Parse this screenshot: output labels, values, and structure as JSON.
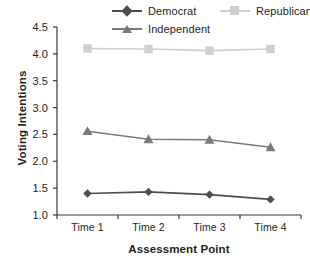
{
  "chart_data": {
    "type": "line",
    "title": "",
    "xlabel": "Assessment Point",
    "ylabel": "Voting Intentions",
    "categories": [
      "Time 1",
      "Time 2",
      "Time 3",
      "Time 4"
    ],
    "ylim": [
      1.0,
      4.5
    ],
    "yticks": [
      "1.0",
      "1.5",
      "2.0",
      "2.5",
      "3.0",
      "3.5",
      "4.0",
      "4.5"
    ],
    "ytick_values": [
      1.0,
      1.5,
      2.0,
      2.5,
      3.0,
      3.5,
      4.0,
      4.5
    ],
    "grid": false,
    "legend_position": "top",
    "series": [
      {
        "name": "Democrat",
        "marker": "diamond",
        "color": "#4d4d4d",
        "values": [
          1.4,
          1.43,
          1.38,
          1.29
        ]
      },
      {
        "name": "Republican",
        "marker": "square",
        "color": "#cfcfcf",
        "values": [
          4.1,
          4.09,
          4.06,
          4.09
        ]
      },
      {
        "name": "Independent",
        "marker": "triangle",
        "color": "#7a7a7a",
        "values": [
          2.56,
          2.41,
          2.4,
          2.26
        ]
      }
    ]
  },
  "legend": {
    "entries": [
      {
        "label": "Democrat"
      },
      {
        "label": "Republican"
      },
      {
        "label": "Independent"
      }
    ]
  },
  "axes": {
    "y_title": "Voting Intentions",
    "x_title": "Assessment Point",
    "y_labels": [
      "4.5",
      "4.0",
      "3.5",
      "3.0",
      "2.5",
      "2.0",
      "1.5",
      "1.0"
    ],
    "x_labels": [
      "Time 1",
      "Time 2",
      "Time 3",
      "Time 4"
    ]
  },
  "colors": {
    "democrat": "#4d4d4d",
    "republican": "#cfcfcf",
    "independent": "#7a7a7a",
    "axis": "#3a3a3a",
    "text": "#231f20"
  }
}
